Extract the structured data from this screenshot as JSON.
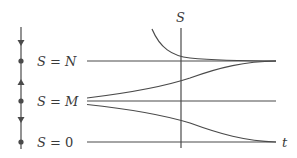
{
  "diagram": {
    "type": "phase-line-and-solution-curves",
    "colors": {
      "stroke": "#4a4a4a",
      "text": "#3a3a3a",
      "background": "#ffffff"
    },
    "axes": {
      "vertical_label": "S",
      "horizontal_label": "t"
    },
    "phase_line": {
      "equilibria": [
        {
          "name": "N",
          "label_var": "S",
          "label_eq": "=",
          "label_val": "N",
          "y": 61
        },
        {
          "name": "M",
          "label_var": "S",
          "label_eq": "=",
          "label_val": "M",
          "y": 101
        },
        {
          "name": "0",
          "label_var": "S",
          "label_eq": "=",
          "label_val": "0",
          "y": 142
        }
      ],
      "arrows": [
        {
          "region": "above N",
          "direction": "down"
        },
        {
          "region": "between M and N",
          "direction": "up"
        },
        {
          "region": "between 0 and M",
          "direction": "down"
        }
      ]
    },
    "solution_curves": [
      {
        "description": "decreasing from above N toward N",
        "asymptote": "N"
      },
      {
        "description": "constant at N",
        "asymptote": "N"
      },
      {
        "description": "increasing from just above M toward N",
        "asymptote": "N"
      },
      {
        "description": "constant at M",
        "asymptote": "M"
      },
      {
        "description": "decreasing from just below M toward 0",
        "asymptote": "0"
      },
      {
        "description": "constant at 0",
        "asymptote": "0"
      }
    ]
  }
}
